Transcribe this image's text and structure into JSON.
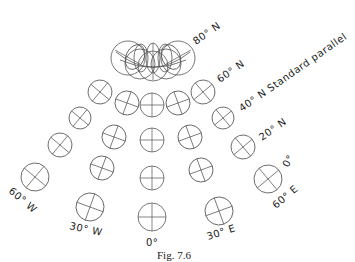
{
  "figure": {
    "caption": "Fig. 7.6",
    "labels": {
      "lat80": "80° N",
      "lat60": "60° N",
      "lat40": "40° N Standard parallel",
      "lat20": "20° N",
      "lat0": "0°",
      "lon60w": "60° W",
      "lon30w": "30° W",
      "lon0": "0°",
      "lon30e": "30° E",
      "lon60e": "60° E"
    }
  },
  "indicatrices": [
    {
      "row": "60N",
      "cx": 100,
      "cy": 92,
      "r": 12,
      "rot": 40
    },
    {
      "row": "60N",
      "cx": 127,
      "cy": 103,
      "r": 12,
      "rot": 20
    },
    {
      "row": "60N",
      "cx": 152,
      "cy": 105,
      "r": 12,
      "rot": 0
    },
    {
      "row": "60N",
      "cx": 178,
      "cy": 103,
      "r": 12,
      "rot": -20
    },
    {
      "row": "60N",
      "cx": 203,
      "cy": 92,
      "r": 12,
      "rot": -40
    },
    {
      "row": "40N",
      "cx": 80,
      "cy": 118,
      "r": 11,
      "rot": 40
    },
    {
      "row": "40N",
      "cx": 114,
      "cy": 137,
      "r": 12,
      "rot": 20
    },
    {
      "row": "40N",
      "cx": 152,
      "cy": 140,
      "r": 12,
      "rot": 0
    },
    {
      "row": "40N",
      "cx": 190,
      "cy": 137,
      "r": 12,
      "rot": -20
    },
    {
      "row": "40N",
      "cx": 223,
      "cy": 118,
      "r": 11,
      "rot": -40
    },
    {
      "row": "20N",
      "cx": 60,
      "cy": 145,
      "r": 12,
      "rot": 40
    },
    {
      "row": "20N",
      "cx": 102,
      "cy": 168,
      "r": 12,
      "rot": 20
    },
    {
      "row": "20N",
      "cx": 152,
      "cy": 178,
      "r": 12,
      "rot": 0
    },
    {
      "row": "20N",
      "cx": 201,
      "cy": 170,
      "r": 12,
      "rot": -20
    },
    {
      "row": "20N",
      "cx": 243,
      "cy": 147,
      "r": 12,
      "rot": -40
    },
    {
      "row": "0",
      "cx": 35,
      "cy": 177,
      "r": 14,
      "rot": 40
    },
    {
      "row": "0",
      "cx": 90,
      "cy": 207,
      "r": 14,
      "rot": 20
    },
    {
      "row": "0",
      "cx": 152,
      "cy": 217,
      "r": 14,
      "rot": 0
    },
    {
      "row": "0",
      "cx": 219,
      "cy": 211,
      "r": 14,
      "rot": -20
    },
    {
      "row": "0",
      "cx": 268,
      "cy": 179,
      "r": 14,
      "rot": -40
    }
  ]
}
